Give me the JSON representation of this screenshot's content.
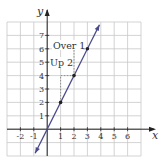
{
  "chart_data": {
    "type": "line",
    "title": "",
    "xlabel": "x",
    "ylabel": "y",
    "xlim": [
      -3,
      7
    ],
    "ylim": [
      -2,
      8
    ],
    "grid": true,
    "x_ticks": [
      "-2",
      "-1",
      "1",
      "2",
      "3",
      "4",
      "5",
      "6"
    ],
    "x_tick_values": [
      -2,
      -1,
      1,
      2,
      3,
      4,
      5,
      6
    ],
    "y_ticks": [
      "1",
      "2",
      "3",
      "4",
      "5",
      "6",
      "7"
    ],
    "y_tick_values": [
      1,
      2,
      3,
      4,
      5,
      6,
      7
    ],
    "series": [
      {
        "name": "y = 2x",
        "equation": "y = 2x",
        "x": [
          0,
          1,
          2,
          3
        ],
        "y": [
          0,
          2,
          4,
          6
        ],
        "marked_points": [
          [
            1,
            2
          ],
          [
            2,
            4
          ],
          [
            3,
            6
          ]
        ],
        "line_extent": [
          [
            -0.9,
            -1.8
          ],
          [
            3.9,
            7.8
          ]
        ]
      }
    ],
    "annotations": [
      {
        "text": "Over 1",
        "near": [
          2.5,
          6.5
        ],
        "meaning": "run from x=2 to x=3"
      },
      {
        "text": "Up 2",
        "near": [
          1.5,
          5
        ],
        "meaning": "rise from y=4 to y=6"
      }
    ],
    "colors": {
      "line": "#4a4a8a",
      "grid": "#c8c8c8",
      "axis": "#222222",
      "dashed": "#777777",
      "text": "#333333"
    }
  },
  "labels": {
    "x_axis": "x",
    "y_axis": "y",
    "over": "Over 1",
    "up": "Up 2",
    "xt": [
      "-2",
      "-1",
      "1",
      "2",
      "3",
      "4",
      "5",
      "6"
    ],
    "yt": [
      "1",
      "2",
      "3",
      "4",
      "5",
      "6",
      "7"
    ]
  }
}
